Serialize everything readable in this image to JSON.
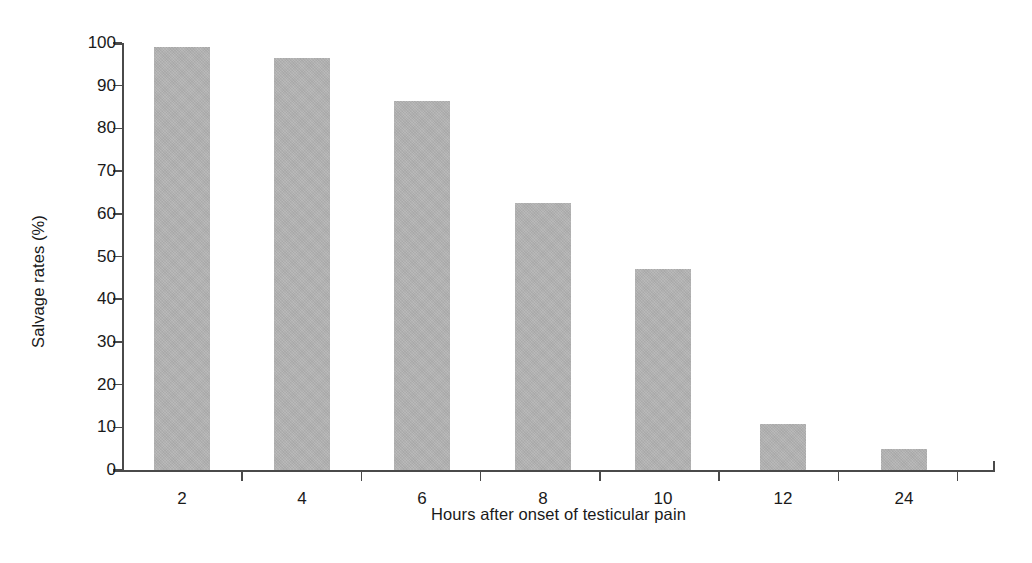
{
  "chart_data": {
    "type": "bar",
    "title": "",
    "subtitle": "",
    "xlabel": "Hours after onset of testicular pain",
    "ylabel": "Salvage rates (%)",
    "categories": [
      "2",
      "4",
      "6",
      "8",
      "10",
      "12",
      "24"
    ],
    "values": [
      99,
      96.5,
      86.5,
      62.5,
      47,
      10.8,
      5
    ],
    "series": [
      {
        "name": "Salvage rate",
        "values": [
          99,
          96.5,
          86.5,
          62.5,
          47,
          10.8,
          5
        ]
      }
    ],
    "ylim": [
      0,
      100
    ],
    "ytick_labels": [
      "0",
      "10",
      "20",
      "30",
      "40",
      "50",
      "60",
      "70",
      "80",
      "90",
      "100"
    ],
    "ytick_values": [
      0,
      10,
      20,
      30,
      40,
      50,
      60,
      70,
      80,
      90,
      100
    ],
    "grid": false,
    "legend": null,
    "legend_position": "none",
    "annotations": [],
    "bar_color": "#b2b2b2",
    "axis_color": "#4a4a4a",
    "text_color": "#1a1a1a",
    "background_color": "#ffffff",
    "bar_widths_px": [
      56,
      56,
      56,
      56,
      56,
      46,
      46
    ],
    "bar_centers_px": [
      60,
      180,
      300,
      421,
      541,
      661,
      782
    ]
  }
}
